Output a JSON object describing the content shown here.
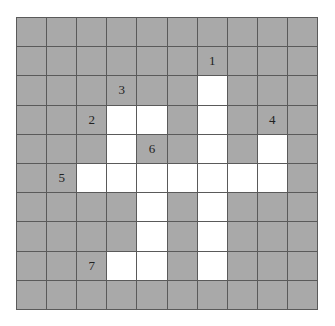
{
  "puzzle": {
    "type": "crossword-grid",
    "rows": 10,
    "cols": 10,
    "colors": {
      "block": "#a9a9a9",
      "open": "#ffffff",
      "line": "#5a5a5a"
    },
    "open_cells": [
      [
        2,
        6
      ],
      [
        3,
        3
      ],
      [
        3,
        4
      ],
      [
        3,
        6
      ],
      [
        4,
        3
      ],
      [
        4,
        6
      ],
      [
        4,
        8
      ],
      [
        5,
        2
      ],
      [
        5,
        3
      ],
      [
        5,
        4
      ],
      [
        5,
        5
      ],
      [
        5,
        6
      ],
      [
        5,
        7
      ],
      [
        5,
        8
      ],
      [
        6,
        4
      ],
      [
        6,
        6
      ],
      [
        7,
        4
      ],
      [
        7,
        6
      ],
      [
        8,
        3
      ],
      [
        8,
        4
      ],
      [
        8,
        6
      ]
    ],
    "clue_numbers": [
      {
        "label": "1",
        "row": 1,
        "col": 6
      },
      {
        "label": "3",
        "row": 2,
        "col": 3
      },
      {
        "label": "2",
        "row": 3,
        "col": 2
      },
      {
        "label": "4",
        "row": 3,
        "col": 8
      },
      {
        "label": "6",
        "row": 4,
        "col": 4
      },
      {
        "label": "5",
        "row": 5,
        "col": 1
      },
      {
        "label": "7",
        "row": 8,
        "col": 2
      }
    ]
  }
}
